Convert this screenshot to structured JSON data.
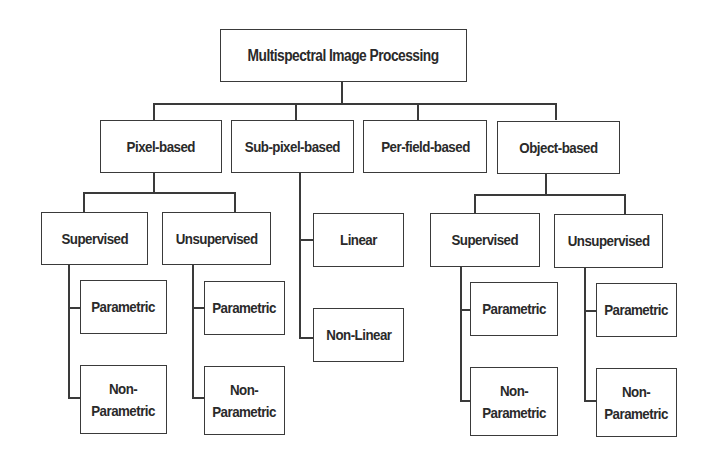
{
  "diagram": {
    "title": "Multispectral Image Processing",
    "root": {
      "label": "Multispectral Image Processing"
    },
    "level1": [
      {
        "label": "Pixel-based"
      },
      {
        "label": "Sub-pixel-based"
      },
      {
        "label": "Per-field-based"
      },
      {
        "label": "Object-based"
      }
    ],
    "pixel_based": {
      "supervised": {
        "label": "Supervised",
        "children": [
          {
            "label": "Parametric"
          },
          {
            "label": "Non-\nParametric"
          }
        ]
      },
      "unsupervised": {
        "label": "Unsupervised",
        "children": [
          {
            "label": "Parametric"
          },
          {
            "label": "Non-\nParametric"
          }
        ]
      }
    },
    "sub_pixel_based": {
      "children": [
        {
          "label": "Linear"
        },
        {
          "label": "Non-Linear"
        }
      ]
    },
    "object_based": {
      "supervised": {
        "label": "Supervised",
        "children": [
          {
            "label": "Parametric"
          },
          {
            "label": "Non-\nParametric"
          }
        ]
      },
      "unsupervised": {
        "label": "Unsupervised",
        "children": [
          {
            "label": "Parametric"
          },
          {
            "label": "Non-\nParametric"
          }
        ]
      }
    },
    "colors": {
      "line": "#3a3a3a",
      "text": "#2a2a2a",
      "background": "#ffffff"
    }
  }
}
